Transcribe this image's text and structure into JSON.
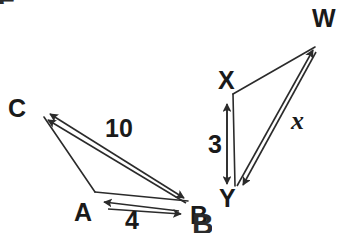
{
  "figure": {
    "background_color": "#ffffff",
    "stroke_color": "#2b2b2b",
    "text_color": "#1a1a1a",
    "width": 345,
    "height": 233
  },
  "left_triangle": {
    "name": "triangle-abc",
    "vertices": [
      {
        "label": "C",
        "x": 40,
        "y": 110
      },
      {
        "label": "A",
        "x": 93,
        "y": 195
      },
      {
        "label": "B",
        "x": 190,
        "y": 205
      }
    ],
    "vertex_labels": {
      "c": "C",
      "a": "A",
      "b": "B"
    },
    "measures": [
      {
        "label": "10",
        "between": "C-B"
      },
      {
        "label": "4",
        "between": "A-B"
      }
    ],
    "measure_labels": {
      "cb": "10",
      "ab": "4"
    }
  },
  "right_triangle": {
    "name": "triangle-xyw",
    "vertices": [
      {
        "label": "W",
        "x": 320,
        "y": 40
      },
      {
        "label": "X",
        "x": 230,
        "y": 90
      },
      {
        "label": "Y",
        "x": 232,
        "y": 192
      }
    ],
    "vertex_labels": {
      "w": "W",
      "x": "X",
      "y": "Y"
    },
    "measures": [
      {
        "label": "3",
        "between": "X-Y"
      },
      {
        "label": "x",
        "between": "Y-W"
      }
    ],
    "measure_labels": {
      "xy": "3",
      "yw": "x"
    }
  },
  "edge_artifacts": {
    "top_left": "e",
    "bottom_center": "B"
  }
}
